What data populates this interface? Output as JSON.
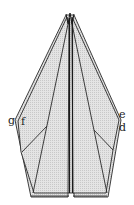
{
  "diagram": {
    "type": "origami-fold-step",
    "fill_color": "#d9d9d9",
    "line_color": "#2a2a2a",
    "labels": {
      "g": "g",
      "f": "f",
      "e": "e",
      "d": "d"
    }
  }
}
